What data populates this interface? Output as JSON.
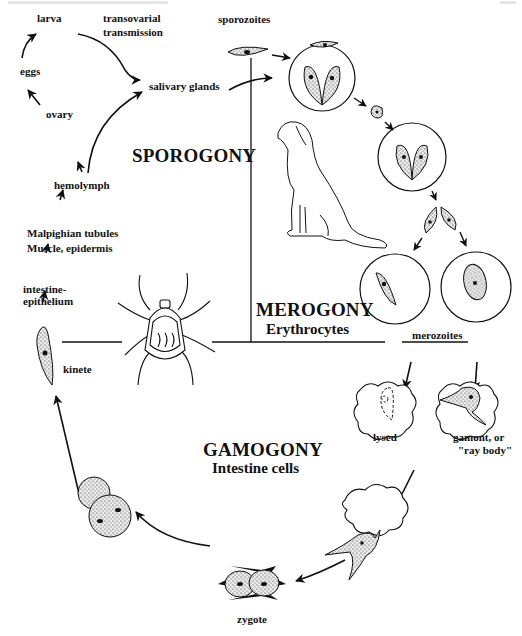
{
  "figure": {
    "phases": {
      "sporogony": "SPOROGONY",
      "merogony": "MEROGONY",
      "merogony_sub": "Erythrocytes",
      "gamogony": "GAMOGONY",
      "gamogony_sub": "Intestine cells"
    },
    "tick_stages": {
      "larva": "larva",
      "transovarial_1": "transovarial",
      "transovarial_2": "transmission",
      "eggs": "eggs",
      "ovary": "ovary",
      "salivary_glands": "salivary glands",
      "hemolymph": "hemolymph",
      "malpighian_1": "Malpighian tubules",
      "malpighian_2": "Muscle, epidermis",
      "intestine_1": "intestine-",
      "intestine_2": "epithelium",
      "kinete": "kinete"
    },
    "host_stages": {
      "sporozoites": "sporozoites",
      "merozoites": "merozoites",
      "lysed": "lysed",
      "gamont_1": "gamont, or",
      "gamont_2": "\"ray body\"",
      "zygote": "zygote"
    },
    "illustrations": [
      "tick-icon",
      "dog-icon",
      "erythrocyte-icon",
      "parasite-cell-icon"
    ],
    "colors": {
      "ink": "#111111",
      "background": "#ffffff"
    }
  }
}
